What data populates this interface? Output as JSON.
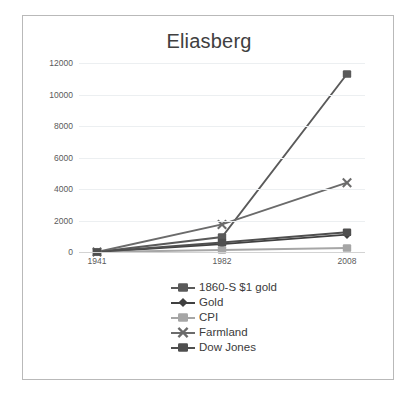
{
  "chart_data": {
    "type": "line",
    "title": "Eliasberg",
    "xlabel": "",
    "ylabel": "",
    "categories": [
      "1941",
      "1982",
      "2008"
    ],
    "ylim": [
      0,
      12000
    ],
    "ytick_step": 2000,
    "yticks": [
      "12000",
      "10000",
      "8000",
      "6000",
      "4000",
      "2000",
      "0"
    ],
    "ytick_values": [
      12000,
      10000,
      8000,
      6000,
      4000,
      2000,
      0
    ],
    "grid": true,
    "legend_position": "bottom",
    "series": [
      {
        "name": "1860-S $1 gold",
        "values": [
          0,
          950,
          11300
        ],
        "color": "#5a5a5a",
        "marker": "square"
      },
      {
        "name": "Gold",
        "values": [
          0,
          500,
          1100
        ],
        "color": "#404040",
        "marker": "diamond"
      },
      {
        "name": "CPI",
        "values": [
          0,
          130,
          250
        ],
        "color": "#a6a6a6",
        "marker": "square"
      },
      {
        "name": "Farmland",
        "values": [
          0,
          1750,
          4400
        ],
        "color": "#6b6b6b",
        "marker": "x"
      },
      {
        "name": "Dow Jones",
        "values": [
          0,
          600,
          1250
        ],
        "color": "#4f4f4f",
        "marker": "square"
      }
    ]
  },
  "legend": {
    "items": [
      {
        "label": "1860-S $1 gold"
      },
      {
        "label": "Gold"
      },
      {
        "label": "CPI"
      },
      {
        "label": "Farmland"
      },
      {
        "label": "Dow Jones"
      }
    ]
  },
  "colors": {
    "frame_border": "#b9b9b9",
    "gridline": "#eceff1",
    "axis": "#d3d3d3",
    "tick_text": "#5a5a5a",
    "title_text": "#404040",
    "legend_text": "#3b3b3b",
    "background": "#ffffff"
  }
}
